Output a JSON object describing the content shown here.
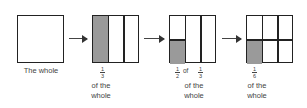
{
  "panels": [
    {
      "label": "The whole"
    },
    {
      "fraction": {
        "num": "1",
        "den": "3"
      },
      "caption_line1": "of the",
      "caption_line2": "whole"
    },
    {
      "fraction_a": {
        "num": "1",
        "den": "2"
      },
      "of_word": "of",
      "fraction_b": {
        "num": "1",
        "den": "3"
      },
      "caption_line1": "of the",
      "caption_line2": "whole"
    },
    {
      "fraction": {
        "num": "1",
        "den": "6"
      },
      "caption_line1": "of the",
      "caption_line2": "whole"
    }
  ],
  "colors": {
    "shade": "#9a9a9a",
    "line": "#222222"
  }
}
